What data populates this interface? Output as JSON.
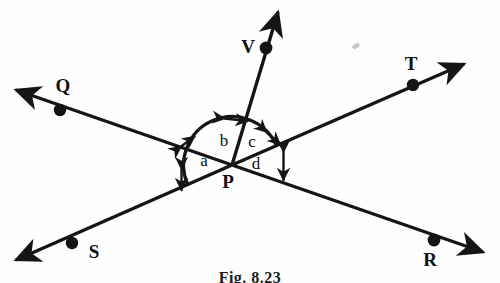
{
  "figure": {
    "caption": "Fig. 8.23",
    "vertex_label": "P",
    "ink_color": "#151515",
    "background_color": "#fefefe"
  },
  "points": [
    {
      "id": "Q",
      "label": "Q",
      "dot_x": 60,
      "dot_y": 110,
      "label_x": 63,
      "label_y": 92,
      "name": "point-q"
    },
    {
      "id": "T",
      "label": "T",
      "dot_x": 413,
      "dot_y": 85,
      "label_x": 411,
      "label_y": 70,
      "name": "point-t"
    },
    {
      "id": "V",
      "label": "V",
      "dot_x": 266,
      "dot_y": 48,
      "label_x": 248,
      "label_y": 53,
      "name": "point-v"
    },
    {
      "id": "S",
      "label": "S",
      "dot_x": 72,
      "dot_y": 243,
      "label_x": 94,
      "label_y": 258,
      "name": "point-s"
    },
    {
      "id": "R",
      "label": "R",
      "dot_x": 434,
      "dot_y": 240,
      "label_x": 430,
      "label_y": 266,
      "name": "point-r"
    },
    {
      "id": "P",
      "label": "P",
      "dot_x": 232,
      "dot_y": 165,
      "label_x": 228,
      "label_y": 188,
      "name": "point-p"
    }
  ],
  "vertex": {
    "x": 232,
    "y": 165
  },
  "rays": [
    {
      "id": "PQ",
      "from": "P",
      "to": "Q",
      "tip_x": 11,
      "tip_y": 88,
      "arrow": true,
      "name": "ray-pq"
    },
    {
      "id": "PR",
      "from": "P",
      "to": "R",
      "tip_x": 488,
      "tip_y": 254,
      "arrow": true,
      "name": "ray-pr"
    },
    {
      "id": "PS",
      "from": "P",
      "to": "S",
      "tip_x": 10,
      "tip_y": 262,
      "arrow": true,
      "name": "ray-ps"
    },
    {
      "id": "PT",
      "from": "P",
      "to": "T",
      "tip_x": 469,
      "tip_y": 62,
      "arrow": true,
      "name": "ray-pt"
    },
    {
      "id": "PV",
      "from": "P",
      "to": "V",
      "tip_x": 280,
      "tip_y": 5,
      "arrow": true,
      "name": "ray-pv"
    }
  ],
  "angles": [
    {
      "id": "a",
      "label": "a",
      "label_x": 204,
      "label_y": 166,
      "between": [
        "PQ",
        "PS"
      ],
      "name": "angle-label-a"
    },
    {
      "id": "b",
      "label": "b",
      "label_x": 224,
      "label_y": 146,
      "between": [
        "PQ",
        "PV"
      ],
      "name": "angle-label-b"
    },
    {
      "id": "c",
      "label": "c",
      "label_x": 252,
      "label_y": 147,
      "between": [
        "PV",
        "PT"
      ],
      "name": "angle-label-c"
    },
    {
      "id": "d",
      "label": "d",
      "label_x": 256,
      "label_y": 169,
      "between": [
        "PT",
        "PR"
      ],
      "name": "angle-label-d"
    }
  ],
  "arc": {
    "radius": 46,
    "description": "semicircular arc above line SR spanning from ray PS side to ray PR side",
    "tick_count": 5
  }
}
